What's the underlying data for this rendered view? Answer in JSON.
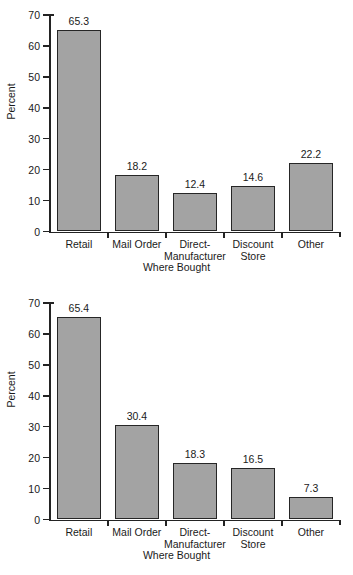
{
  "chart_data": [
    {
      "type": "bar",
      "title": "",
      "categories": [
        "Retail",
        "Mail Order",
        "Direct-Manufacturer",
        "Discount Store",
        "Other"
      ],
      "category_lines": [
        [
          "Retail"
        ],
        [
          "Mail Order"
        ],
        [
          "Direct-",
          "Manufacturer"
        ],
        [
          "Discount",
          "Store"
        ],
        [
          "Other"
        ]
      ],
      "values": [
        65.3,
        18.2,
        12.4,
        14.6,
        22.2
      ],
      "value_labels": [
        "65.3",
        "18.2",
        "12.4",
        "14.6",
        "22.2"
      ],
      "xlabel": "Where Bought",
      "ylabel": "Percent",
      "ylim": [
        0,
        70
      ],
      "yticks": [
        0,
        10,
        20,
        30,
        40,
        50,
        60,
        70
      ],
      "ytick_labels": [
        "0",
        "10",
        "20",
        "30",
        "40",
        "50",
        "60",
        "70"
      ],
      "grid": false,
      "legend": "none",
      "bar_fill": "#a3a3a3",
      "bar_edge": "#262626"
    },
    {
      "type": "bar",
      "title": "",
      "categories": [
        "Retail",
        "Mail Order",
        "Direct-Manufacturer",
        "Discount Store",
        "Other"
      ],
      "category_lines": [
        [
          "Retail"
        ],
        [
          "Mail Order"
        ],
        [
          "Direct-",
          "Manufacturer"
        ],
        [
          "Discount",
          "Store"
        ],
        [
          "Other"
        ]
      ],
      "values": [
        65.4,
        30.4,
        18.3,
        16.5,
        7.3
      ],
      "value_labels": [
        "65.4",
        "30.4",
        "18.3",
        "16.5",
        "7.3"
      ],
      "xlabel": "Where Bought",
      "ylabel": "Percent",
      "ylim": [
        0,
        70
      ],
      "yticks": [
        0,
        10,
        20,
        30,
        40,
        50,
        60,
        70
      ],
      "ytick_labels": [
        "0",
        "10",
        "20",
        "30",
        "40",
        "50",
        "60",
        "70"
      ],
      "grid": false,
      "legend": "none",
      "bar_fill": "#a3a3a3",
      "bar_edge": "#262626"
    }
  ]
}
